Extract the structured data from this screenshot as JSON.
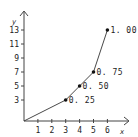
{
  "chart_data": {
    "type": "line",
    "title": "",
    "xlabel": "x",
    "ylabel": "y",
    "x_ticks": [
      1,
      2,
      3,
      4,
      5,
      6
    ],
    "y_ticks": [
      3,
      5,
      7,
      9,
      11,
      13
    ],
    "xlim": [
      0,
      6.8
    ],
    "ylim": [
      0,
      14
    ],
    "grid": false,
    "legend": null,
    "series": [
      {
        "name": "curve",
        "x": [
          0,
          3,
          4,
          5,
          6
        ],
        "y": [
          0,
          3,
          5,
          7,
          13
        ],
        "marker_points": [
          {
            "x": 3,
            "y": 3,
            "label": "0.25"
          },
          {
            "x": 4,
            "y": 5,
            "label": "0.50"
          },
          {
            "x": 5,
            "y": 7,
            "label": "0.75"
          },
          {
            "x": 6,
            "y": 13,
            "label": "1.00"
          }
        ]
      }
    ]
  },
  "colors": {
    "axis": "#444444",
    "line": "#333333",
    "marker": "#111111",
    "text": "#222222"
  }
}
